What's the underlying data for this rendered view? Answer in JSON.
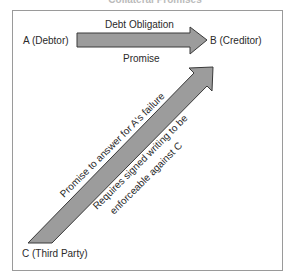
{
  "title": "Collateral Promises",
  "parties": {
    "a": "A (Debtor)",
    "b": "B (Creditor)",
    "c": "C (Third Party)"
  },
  "arrows": {
    "horizontal": {
      "label_above": "Debt Obligation",
      "label_below": "Promise",
      "fill": "#9c9c9c",
      "stroke": "#3a3a3a"
    },
    "diagonal": {
      "label_above": "Promise to answer for A's failure",
      "label_below_line1": "Requires signed writing to be",
      "label_below_line2": "enforceable against C",
      "fill": "#9c9c9c",
      "stroke": "#3a3a3a"
    }
  }
}
